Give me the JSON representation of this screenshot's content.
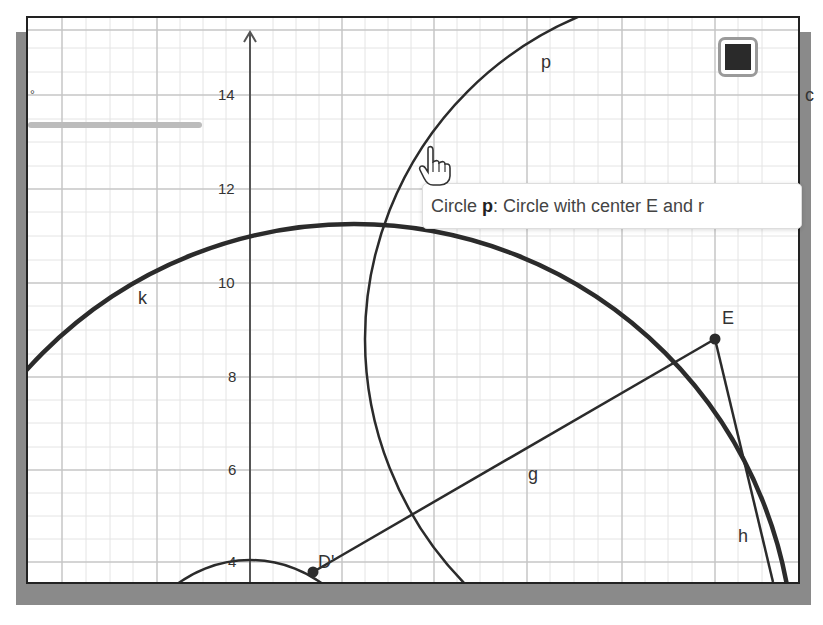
{
  "graphics_view": {
    "y_axis_ticks": [
      {
        "value": "14",
        "y": 93
      },
      {
        "value": "12",
        "y": 187
      },
      {
        "value": "10",
        "y": 281
      },
      {
        "value": "8",
        "y": 375
      },
      {
        "value": "6",
        "y": 468
      },
      {
        "value": "4",
        "y": 560
      }
    ],
    "objects": [
      {
        "name": "k",
        "type": "circle",
        "label": "k"
      },
      {
        "name": "p",
        "type": "circle",
        "label": "p"
      },
      {
        "name": "g",
        "type": "segment",
        "label": "g"
      },
      {
        "name": "h",
        "type": "segment",
        "label": "h"
      },
      {
        "name": "E",
        "type": "point",
        "label": "E"
      },
      {
        "name": "D'",
        "type": "point",
        "label": "D'"
      }
    ],
    "slider_unit": "°",
    "cropped_text_right": "c"
  },
  "style_bar": {
    "color_swatch": "#2a2a2a"
  },
  "tooltip": {
    "prefix": "Circle ",
    "object": "p",
    "text": ": Circle with center E and r"
  },
  "colors": {
    "line": "#2b2b2b",
    "grid_major": "#c8c8c8",
    "grid_minor": "#e6e6e6",
    "frame_shadow": "#8a8a8a"
  }
}
